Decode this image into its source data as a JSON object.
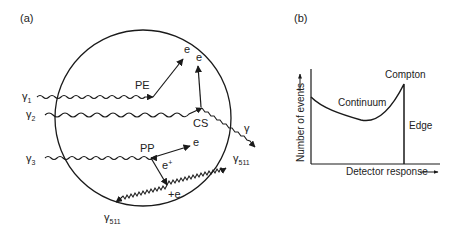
{
  "panel_a": {
    "label": "(a)",
    "gammas": {
      "g1": {
        "sym": "γ",
        "sub": "1"
      },
      "g2": {
        "sym": "γ",
        "sub": "2"
      },
      "g3": {
        "sym": "γ",
        "sub": "3"
      }
    },
    "interactions": {
      "pe": "PE",
      "cs": "CS",
      "pp": "PP"
    },
    "particles": {
      "pe_electron": "e",
      "cs_electron": "e",
      "cs_gamma": "γ",
      "pp_electron": "e",
      "pp_positron": {
        "sym": "e",
        "sup": "+"
      },
      "annihilation": "+e",
      "gamma511_right": {
        "sym": "γ",
        "sub": "511"
      },
      "gamma511_left": {
        "sym": "γ",
        "sub": "511"
      }
    }
  },
  "panel_b": {
    "label": "(b)",
    "ylabel": "Number of events",
    "xlabel": "Detector response",
    "annotations": {
      "continuum": "Continuum",
      "compton": "Compton",
      "edge": "Edge"
    }
  },
  "colors": {
    "line": "#1a1a1a",
    "background": "#ffffff"
  }
}
